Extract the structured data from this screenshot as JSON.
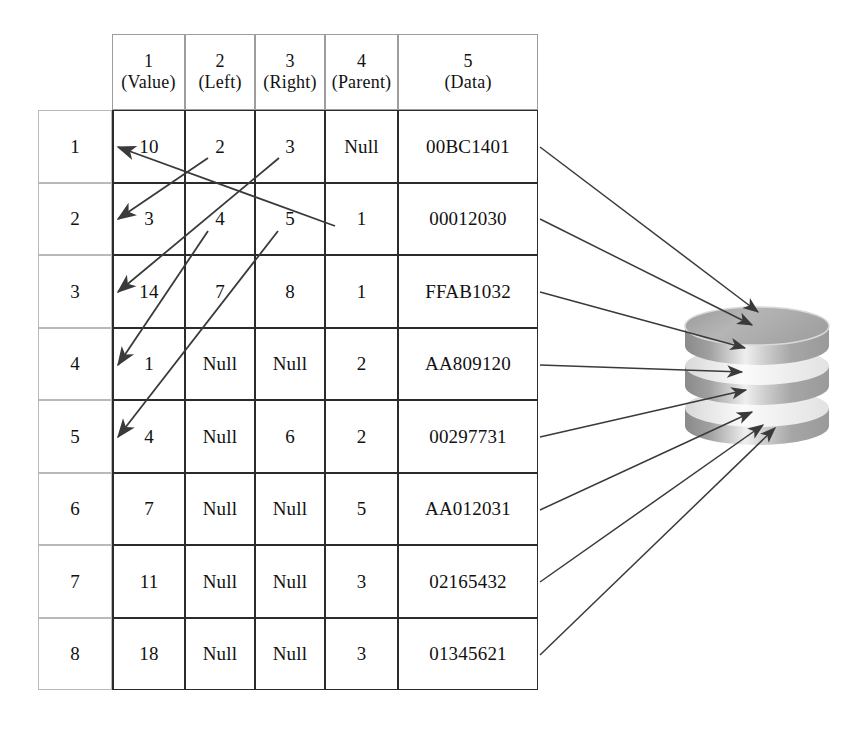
{
  "diagram": {
    "type": "table-to-database-diagram"
  },
  "table": {
    "corner_label": "",
    "headers": [
      {
        "num": "1",
        "name": "(Value)"
      },
      {
        "num": "2",
        "name": "(Left)"
      },
      {
        "num": "3",
        "name": "(Right)"
      },
      {
        "num": "4",
        "name": "(Parent)"
      },
      {
        "num": "5",
        "name": "(Data)"
      }
    ],
    "rows": [
      {
        "index": "1",
        "value": "10",
        "left": "2",
        "right": "3",
        "parent": "Null",
        "data": "00BC1401"
      },
      {
        "index": "2",
        "value": "3",
        "left": "4",
        "right": "5",
        "parent": "1",
        "data": "00012030"
      },
      {
        "index": "3",
        "value": "14",
        "left": "7",
        "right": "8",
        "parent": "1",
        "data": "FFAB1032"
      },
      {
        "index": "4",
        "value": "1",
        "left": "Null",
        "right": "Null",
        "parent": "2",
        "data": "AA809120"
      },
      {
        "index": "5",
        "value": "4",
        "left": "Null",
        "right": "6",
        "parent": "2",
        "data": "00297731"
      },
      {
        "index": "6",
        "value": "7",
        "left": "Null",
        "right": "Null",
        "parent": "5",
        "data": "AA012031"
      },
      {
        "index": "7",
        "value": "11",
        "left": "Null",
        "right": "Null",
        "parent": "3",
        "data": "02165432"
      },
      {
        "index": "8",
        "value": "18",
        "left": "Null",
        "right": "Null",
        "parent": "3",
        "data": "01345621"
      }
    ]
  },
  "pointer_arrows": [
    {
      "name": "row1-left-to-row2",
      "from_row": "1",
      "from_col": "left",
      "to_row": "2"
    },
    {
      "name": "row1-right-to-row3",
      "from_row": "1",
      "from_col": "right",
      "to_row": "3"
    },
    {
      "name": "row2-parent-to-row1",
      "from_row": "2",
      "from_col": "parent",
      "to_row": "1"
    },
    {
      "name": "row2-left-to-row4",
      "from_row": "2",
      "from_col": "left",
      "to_row": "4"
    },
    {
      "name": "row2-right-to-row5",
      "from_row": "2",
      "from_col": "right",
      "to_row": "5"
    }
  ],
  "storage": {
    "label": "database-cylinder",
    "disk_count": 3,
    "colors": {
      "dark": "#8d8d8d",
      "mid": "#a8a8a8",
      "light": "#d6d6d6",
      "highlight": "#f2f2f2",
      "edge": "#6e6e6e"
    },
    "incoming_arrow_count": 8
  },
  "colors": {
    "line": "#3a3a3a",
    "grid_dark": "#2b2b2b",
    "grid_light": "#b9b9b9",
    "header_grid": "#9d9d9d",
    "background": "#ffffff",
    "text": "#111111"
  }
}
